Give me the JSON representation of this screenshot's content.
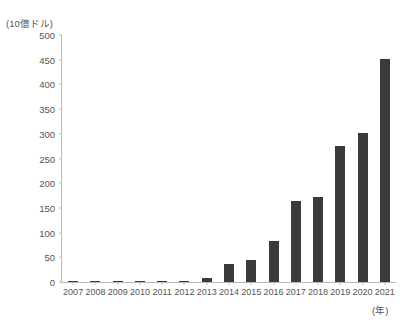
{
  "chart_data": {
    "type": "bar",
    "title": "",
    "xlabel": "(年)",
    "ylabel": "(10億ドル)",
    "ylim": [
      0,
      500
    ],
    "ytick_step": 50,
    "yticks": [
      500,
      450,
      400,
      350,
      300,
      250,
      200,
      150,
      100,
      50,
      0
    ],
    "grid": false,
    "legend": null,
    "bar_color": "#3a3a3a",
    "categories": [
      "2007",
      "2008",
      "2009",
      "2010",
      "2011",
      "2012",
      "2013",
      "2014",
      "2015",
      "2016",
      "2017",
      "2018",
      "2019",
      "2020",
      "2021"
    ],
    "values": [
      1,
      1,
      1,
      2,
      1,
      1,
      9,
      36,
      44,
      83,
      163,
      171,
      274,
      300,
      450
    ],
    "series": [
      {
        "name": "",
        "values": [
          1,
          1,
          1,
          2,
          1,
          1,
          9,
          36,
          44,
          83,
          163,
          171,
          274,
          300,
          450
        ]
      }
    ]
  },
  "axes": {
    "y_unit_caption": "(10億ドル)",
    "x_unit_caption": "(年)"
  },
  "header": {
    "title": ""
  }
}
